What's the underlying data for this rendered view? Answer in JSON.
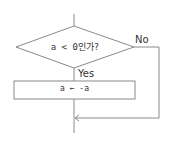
{
  "flowchart": {
    "decision": {
      "text": "a < 0인가?"
    },
    "no_label": "No",
    "yes_label": "Yes",
    "process": {
      "text": "a ← -a"
    }
  },
  "colors": {
    "line": "#8a8a8a",
    "text": "#333333",
    "background": "#ffffff"
  }
}
